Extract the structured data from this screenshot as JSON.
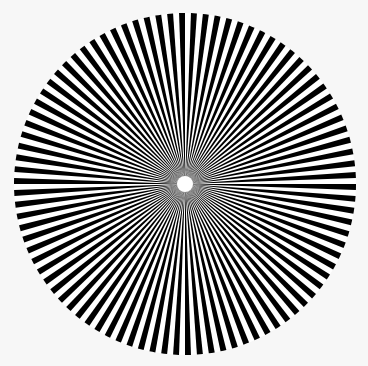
{
  "pattern": {
    "type": "siemens-star",
    "center_x": 185,
    "center_y": 184,
    "radius": 171,
    "spoke_pairs": 90,
    "center_dot_radius": 8,
    "colors": {
      "spoke": "#000000",
      "gap": "#ffffff",
      "background": "#f7f7f7",
      "center_dot": "#ffffff"
    }
  }
}
